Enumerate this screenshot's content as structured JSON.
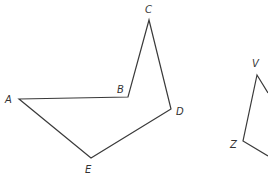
{
  "figure": {
    "stroke_color": "#3a3a3a",
    "label_color": "#333333",
    "polygons": [
      {
        "name": "ABCDE",
        "vertices": [
          {
            "label": "A",
            "x": 19,
            "y": 99,
            "lx": 5,
            "ly": 103
          },
          {
            "label": "B",
            "x": 128,
            "y": 97,
            "lx": 117,
            "ly": 93
          },
          {
            "label": "C",
            "x": 149,
            "y": 20,
            "lx": 145,
            "ly": 13
          },
          {
            "label": "D",
            "x": 171,
            "y": 109,
            "lx": 176,
            "ly": 115
          },
          {
            "label": "E",
            "x": 91,
            "y": 158,
            "lx": 85,
            "ly": 173
          }
        ]
      },
      {
        "name": "VZ-partial",
        "vertices": [
          {
            "label": "V",
            "x": 257,
            "y": 75,
            "lx": 252,
            "ly": 67
          },
          {
            "label": "Z",
            "x": 243,
            "y": 141,
            "lx": 230,
            "ly": 148
          }
        ]
      }
    ],
    "labels": {
      "A": "A",
      "B": "B",
      "C": "C",
      "D": "D",
      "E": "E",
      "V": "V",
      "Z": "Z"
    }
  }
}
